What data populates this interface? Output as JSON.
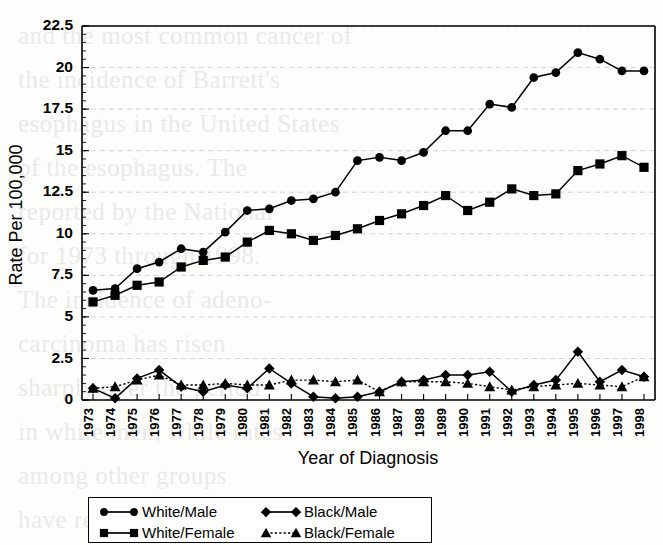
{
  "chart_data": {
    "type": "line",
    "title": "",
    "xlabel": "Year of Diagnosis",
    "ylabel": "Rate Per 100,000",
    "categories": [
      "1973",
      "1974",
      "1975",
      "1976",
      "1977",
      "1978",
      "1979",
      "1980",
      "1981",
      "1982",
      "1983",
      "1984",
      "1985",
      "1986",
      "1987",
      "1988",
      "1989",
      "1990",
      "1991",
      "1992",
      "1993",
      "1994",
      "1995",
      "1996",
      "1997",
      "1998"
    ],
    "x": [
      1973,
      1974,
      1975,
      1976,
      1977,
      1978,
      1979,
      1980,
      1981,
      1982,
      1983,
      1984,
      1985,
      1986,
      1987,
      1988,
      1989,
      1990,
      1991,
      1992,
      1993,
      1994,
      1995,
      1996,
      1997,
      1998
    ],
    "ylim": [
      0,
      22.5
    ],
    "yticks": [
      0,
      2.5,
      5,
      7.5,
      10,
      12.5,
      15,
      17.5,
      20,
      22.5
    ],
    "ytick_labels": [
      "0",
      "2.5",
      "5",
      "7.5",
      "10",
      "12.5",
      "15",
      "17.5",
      "20",
      "22.5"
    ],
    "grid": true,
    "legend_position": "below",
    "series": [
      {
        "name": "White/Male",
        "marker": "circle",
        "line_style": "solid",
        "color": "#000000",
        "values": [
          6.6,
          6.7,
          7.9,
          8.3,
          9.1,
          8.9,
          10.1,
          11.4,
          11.5,
          12.0,
          12.1,
          12.5,
          14.4,
          14.6,
          14.4,
          14.9,
          16.2,
          16.2,
          17.8,
          17.6,
          19.4,
          19.7,
          20.9,
          20.5,
          19.8,
          19.8
        ]
      },
      {
        "name": "White/Female",
        "marker": "square",
        "line_style": "solid",
        "color": "#000000",
        "values": [
          5.9,
          6.3,
          6.9,
          7.1,
          8.0,
          8.4,
          8.6,
          9.5,
          10.2,
          10.0,
          9.6,
          9.9,
          10.3,
          10.8,
          11.2,
          11.7,
          12.3,
          11.4,
          11.9,
          12.7,
          12.3,
          12.4,
          13.8,
          14.2,
          14.7,
          14.0
        ]
      },
      {
        "name": "Black/Male",
        "marker": "diamond",
        "line_style": "solid",
        "color": "#000000",
        "values": [
          0.7,
          0.1,
          1.3,
          1.8,
          0.8,
          0.5,
          0.9,
          0.7,
          1.9,
          1.0,
          0.2,
          0.1,
          0.2,
          0.5,
          1.1,
          1.2,
          1.5,
          1.5,
          1.7,
          0.5,
          0.9,
          1.2,
          2.9,
          1.1,
          1.8,
          1.4
        ]
      },
      {
        "name": "Black/Female",
        "marker": "triangle",
        "line_style": "dotted",
        "color": "#000000",
        "values": [
          0.7,
          0.8,
          1.2,
          1.5,
          0.9,
          0.9,
          1.0,
          0.9,
          0.9,
          1.2,
          1.2,
          1.1,
          1.2,
          0.5,
          1.1,
          1.1,
          1.1,
          1.0,
          0.8,
          0.6,
          0.8,
          0.9,
          1.0,
          0.9,
          0.8,
          1.4
        ]
      }
    ]
  },
  "legend": {
    "entries": [
      {
        "label": "White/Male",
        "marker": "circle",
        "style": "solid"
      },
      {
        "label": "Black/Male",
        "marker": "diamond",
        "style": "solid"
      },
      {
        "label": "White/Female",
        "marker": "square",
        "style": "solid"
      },
      {
        "label": "Black/Female",
        "marker": "triangle",
        "style": "dotted"
      }
    ]
  },
  "background_bleed": [
    "and the most common cancer of",
    "the incidence of Barrett's",
    "esophagus in the United States",
    "of the esophagus. The",
    "reported by the National",
    "for 1973 through 1998.",
    "The incidence of adeno-",
    "carcinoma has risen",
    "sharply over the period",
    "in white men, while rates",
    "among other groups",
    "have remained low."
  ]
}
